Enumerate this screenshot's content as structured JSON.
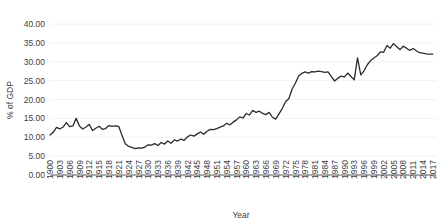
{
  "chart_data": {
    "type": "line",
    "title": "",
    "xlabel": "Year",
    "ylabel": "% of GDP",
    "ylim": [
      0,
      40
    ],
    "ytick_step": 5,
    "yticks": [
      "0.00",
      "5.00",
      "10.00",
      "15.00",
      "20.00",
      "25.00",
      "30.00",
      "35.00",
      "40.00"
    ],
    "xlim": [
      1900,
      2018
    ],
    "xtick_step": 3,
    "xticks": [
      "1900",
      "1903",
      "1906",
      "1909",
      "1912",
      "1915",
      "1918",
      "1921",
      "1924",
      "1927",
      "1930",
      "1933",
      "1936",
      "1939",
      "1942",
      "1945",
      "1948",
      "1951",
      "1954",
      "1957",
      "1960",
      "1963",
      "1966",
      "1969",
      "1972",
      "1975",
      "1978",
      "1981",
      "1984",
      "1987",
      "1990",
      "1993",
      "1996",
      "1999",
      "2002",
      "2005",
      "2008",
      "2011",
      "2014",
      "2017"
    ],
    "grid": true,
    "grid_axis": "y",
    "legend": false,
    "line_color": "#2b2b2b",
    "grid_color": "#f2f2f2",
    "axis_color": "#5a5a5a",
    "series": [
      {
        "name": "Government spending",
        "x": [
          1900,
          1901,
          1902,
          1903,
          1904,
          1905,
          1906,
          1907,
          1908,
          1909,
          1910,
          1911,
          1912,
          1913,
          1914,
          1915,
          1916,
          1917,
          1918,
          1919,
          1920,
          1921,
          1922,
          1923,
          1924,
          1925,
          1926,
          1927,
          1928,
          1929,
          1930,
          1931,
          1932,
          1933,
          1934,
          1935,
          1936,
          1937,
          1938,
          1939,
          1940,
          1941,
          1942,
          1943,
          1944,
          1945,
          1946,
          1947,
          1948,
          1949,
          1950,
          1951,
          1952,
          1953,
          1954,
          1955,
          1956,
          1957,
          1958,
          1959,
          1960,
          1961,
          1962,
          1963,
          1964,
          1965,
          1966,
          1967,
          1968,
          1969,
          1970,
          1971,
          1972,
          1973,
          1974,
          1975,
          1976,
          1977,
          1978,
          1979,
          1980,
          1981,
          1982,
          1983,
          1984,
          1985,
          1986,
          1987,
          1988,
          1989,
          1990,
          1991,
          1992,
          1993,
          1994,
          1995,
          1996,
          1997,
          1998,
          1999,
          2000,
          2001,
          2002,
          2003,
          2004,
          2005,
          2006,
          2007,
          2008,
          2009,
          2010,
          2011,
          2012,
          2013,
          2014,
          2015,
          2016,
          2017
        ],
        "values": [
          10.6,
          11.3,
          12.6,
          12.2,
          12.7,
          13.9,
          12.8,
          13.0,
          15.0,
          13.0,
          12.2,
          12.7,
          13.4,
          11.8,
          12.4,
          12.9,
          12.1,
          12.3,
          13.1,
          12.9,
          13.0,
          12.9,
          10.5,
          8.3,
          7.6,
          7.3,
          7.0,
          7.2,
          7.1,
          7.4,
          8.0,
          7.9,
          8.3,
          7.8,
          8.6,
          8.2,
          9.0,
          8.4,
          9.3,
          9.0,
          9.5,
          9.2,
          10.1,
          10.6,
          10.3,
          10.9,
          11.4,
          10.8,
          11.6,
          12.1,
          12.0,
          12.3,
          12.7,
          13.0,
          13.7,
          13.3,
          14.0,
          14.6,
          15.4,
          15.1,
          16.3,
          15.9,
          17.1,
          16.6,
          16.9,
          16.3,
          16.0,
          16.6,
          15.3,
          14.8,
          16.2,
          17.6,
          19.4,
          20.2,
          22.7,
          24.3,
          26.2,
          26.9,
          27.3,
          27.0,
          27.4,
          27.3,
          27.5,
          27.4,
          27.2,
          27.3,
          26.1,
          24.9,
          25.6,
          26.2,
          26.0,
          27.0,
          26.1,
          25.2,
          31.0,
          26.5,
          27.6,
          29.2,
          30.3,
          31.0,
          31.6,
          32.6,
          32.5,
          34.3,
          33.6,
          34.8,
          34.0,
          33.2,
          34.1,
          33.6,
          33.0,
          33.5,
          32.9,
          32.4,
          32.3,
          32.1,
          32.0,
          32.0
        ]
      }
    ]
  }
}
